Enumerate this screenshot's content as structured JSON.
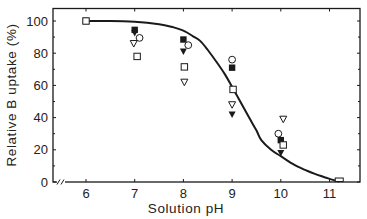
{
  "chart_data": {
    "type": "scatter",
    "title": "",
    "xlabel": "Solution pH",
    "ylabel": "Relative B uptake (%)",
    "xlim": [
      5.32,
      11.63
    ],
    "ylim": [
      0,
      108
    ],
    "x_ticks": [
      6,
      7,
      8,
      9,
      10,
      11
    ],
    "x_tick_labels": [
      "6",
      "7",
      "8",
      "9",
      "10",
      "11"
    ],
    "y_ticks": [
      0,
      20,
      40,
      60,
      80,
      100
    ],
    "y_tick_labels": [
      "0",
      "20",
      "40",
      "60",
      "80",
      "100"
    ],
    "y_minor_ticks": [
      10,
      30,
      50,
      70,
      90
    ],
    "axis_break": "x-axis break near origin (//)",
    "grid": false,
    "legend": "none",
    "series": [
      {
        "name": "filled-square",
        "marker": "square-filled",
        "x": [
          6,
          7,
          8,
          9,
          10
        ],
        "y": [
          100,
          94.5,
          88.5,
          71,
          26
        ]
      },
      {
        "name": "filled-triangle",
        "marker": "triangle-down-filled",
        "x": [
          7,
          8,
          9,
          10
        ],
        "y": [
          92.5,
          81,
          42,
          18
        ]
      },
      {
        "name": "open-circle",
        "marker": "circle-open",
        "x": [
          7.1,
          8.1,
          9,
          9.95
        ],
        "y": [
          89.5,
          85,
          76,
          30
        ]
      },
      {
        "name": "open-triangle",
        "marker": "triangle-down-open",
        "x": [
          6.98,
          8.02,
          9,
          10.05
        ],
        "y": [
          86,
          62,
          48,
          39
        ]
      },
      {
        "name": "open-square",
        "marker": "square-open",
        "x": [
          6,
          7.05,
          8.02,
          9.02,
          10.05
        ],
        "y": [
          100,
          78,
          71.5,
          57.5,
          23
        ]
      },
      {
        "name": "fitted-curve",
        "marker": "line",
        "x": [
          6.0,
          6.5,
          7.0,
          7.5,
          7.8,
          8.0,
          8.2,
          8.35,
          8.5,
          8.67,
          8.85,
          9.0,
          9.15,
          9.35,
          9.5,
          9.6,
          9.8,
          10.0,
          10.2,
          10.35,
          10.5,
          10.7,
          10.9,
          11.05,
          11.2
        ],
        "y": [
          100,
          100,
          99.5,
          98,
          96,
          94,
          90.5,
          87.5,
          82,
          75,
          67,
          59,
          51,
          40,
          32,
          26,
          20,
          16,
          12,
          9.5,
          7.5,
          5,
          3,
          1.5,
          0.3
        ]
      }
    ]
  },
  "axes": {
    "x_title": "Solution pH",
    "y_title": "Relative B uptake (%)"
  }
}
